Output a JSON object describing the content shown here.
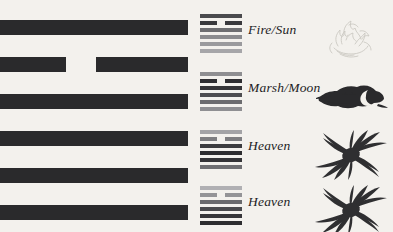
{
  "page": {
    "background_color": "#f3f1ec",
    "line_color": "#2a2a2c"
  },
  "main_hexagram": {
    "name": "large-hexagram",
    "line_count": 6,
    "lines_top_to_bottom": [
      "solid",
      "broken",
      "solid",
      "solid",
      "solid",
      "solid"
    ]
  },
  "rows": [
    {
      "label": "Fire/Sun",
      "hexagram_lines": [
        "solid",
        "broken",
        "solid",
        "solid",
        "solid",
        "solid"
      ],
      "hexagram_shades": [
        "#4a4a4d",
        "#39393c",
        "#6e6e71",
        "#8c8c8f",
        "#9a9a9d",
        "#a6a6a9"
      ],
      "symbol_name": "flame-icon",
      "symbol_color": "#cfccc6"
    },
    {
      "label": "Marsh/Moon",
      "hexagram_lines": [
        "solid",
        "broken",
        "solid",
        "solid",
        "solid",
        "solid"
      ],
      "hexagram_shades": [
        "#8e8e91",
        "#2e2e31",
        "#353538",
        "#4d4d50",
        "#6c6c6f",
        "#8f8f92"
      ],
      "symbol_name": "cloud-moon-icon",
      "symbol_color": "#2a2a2c"
    },
    {
      "label": "Heaven",
      "hexagram_lines": [
        "solid",
        "broken",
        "solid",
        "solid",
        "solid",
        "solid"
      ],
      "hexagram_shades": [
        "#a3a3a6",
        "#7e7e81",
        "#3c3c3f",
        "#2d2d30",
        "#343437",
        "#6f6f72"
      ],
      "symbol_name": "swirl-burst-icon",
      "symbol_color": "#2f2f31"
    },
    {
      "label": "Heaven",
      "hexagram_lines": [
        "solid",
        "broken",
        "solid",
        "solid",
        "solid",
        "solid"
      ],
      "hexagram_shades": [
        "#b0b0b3",
        "#949497",
        "#6a6a6d",
        "#4a4a4d",
        "#363639",
        "#2d2d30"
      ],
      "symbol_name": "swirl-burst-icon",
      "symbol_color": "#2f2f31"
    }
  ]
}
